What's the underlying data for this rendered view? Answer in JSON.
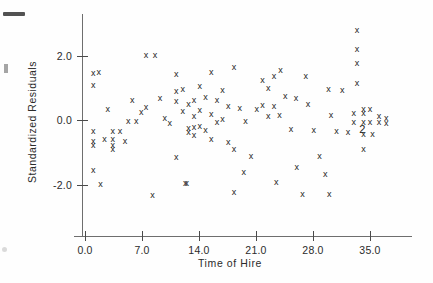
{
  "figure": {
    "marker_glyph": "x",
    "background_color": "#fefefe",
    "axis_color": "#6e6e6e",
    "marker_color": "#1d1d1d"
  },
  "artifacts": {
    "top_bar": "scan-artifact-bar",
    "speck": "scan-artifact-speck"
  },
  "chart_data": {
    "type": "scatter",
    "title": "",
    "xlabel": "Time of Hire",
    "ylabel": "Standardized Residuals",
    "xlim": [
      -1.1,
      39.5
    ],
    "ylim": [
      -3.35,
      3.45
    ],
    "xticks": [
      0.0,
      7.0,
      14.0,
      21.0,
      28.0,
      35.0
    ],
    "xticklabels": [
      "0.0",
      "7.0",
      "14.0",
      "21.0",
      "28.0",
      "35.0"
    ],
    "yticks": [
      2.0,
      0.0,
      -2.0
    ],
    "yticklabels": [
      "2.0",
      "0.0",
      "-2.0"
    ],
    "grid": false,
    "legend": null,
    "marker": "x",
    "series": [
      {
        "name": "residuals",
        "points": [
          [
            1.0,
            1.43
          ],
          [
            1.7,
            1.46
          ],
          [
            1.0,
            1.06
          ],
          [
            2.8,
            0.34
          ],
          [
            1.0,
            -0.37
          ],
          [
            1.0,
            -0.68
          ],
          [
            1.0,
            -0.78
          ],
          [
            1.0,
            -1.58
          ],
          [
            3.4,
            -0.37
          ],
          [
            3.4,
            -0.62
          ],
          [
            3.4,
            -0.78
          ],
          [
            3.4,
            -0.93
          ],
          [
            4.3,
            -0.37
          ],
          [
            1.9,
            -1.99
          ],
          [
            5.3,
            -0.06
          ],
          [
            6.3,
            -0.06
          ],
          [
            6.9,
            0.22
          ],
          [
            7.5,
            0.4
          ],
          [
            7.5,
            1.99
          ],
          [
            8.3,
            -2.33
          ],
          [
            9.2,
            0.68
          ],
          [
            9.8,
            0.06
          ],
          [
            10.4,
            -0.12
          ],
          [
            11.2,
            1.4
          ],
          [
            11.2,
            0.87
          ],
          [
            11.2,
            0.56
          ],
          [
            11.2,
            -1.15
          ],
          [
            12.0,
            0.96
          ],
          [
            12.0,
            0.25
          ],
          [
            12.7,
            0.49
          ],
          [
            12.7,
            -0.25
          ],
          [
            12.7,
            -0.4
          ],
          [
            13.4,
            0.62
          ],
          [
            13.4,
            0.12
          ],
          [
            13.4,
            -0.22
          ],
          [
            13.4,
            -0.49
          ],
          [
            14.1,
            1.03
          ],
          [
            14.1,
            0.31
          ],
          [
            14.1,
            -0.21
          ],
          [
            14.8,
            0.71
          ],
          [
            14.8,
            -0.34
          ],
          [
            15.5,
            1.46
          ],
          [
            15.5,
            0.18
          ],
          [
            15.5,
            -0.62
          ],
          [
            16.2,
            0.62
          ],
          [
            16.2,
            -0.09
          ],
          [
            16.9,
            0.9
          ],
          [
            16.9,
            0.03
          ],
          [
            17.6,
            0.43
          ],
          [
            17.6,
            -0.71
          ],
          [
            18.3,
            1.62
          ],
          [
            18.3,
            -0.93
          ],
          [
            18.3,
            -2.24
          ],
          [
            19.0,
            0.37
          ],
          [
            19.7,
            -0.06
          ],
          [
            20.4,
            -1.12
          ],
          [
            21.1,
            0.34
          ],
          [
            21.8,
            1.21
          ],
          [
            21.8,
            0.46
          ],
          [
            22.5,
            0.99
          ],
          [
            22.5,
            0.12
          ],
          [
            23.2,
            1.34
          ],
          [
            23.2,
            0.43
          ],
          [
            23.9,
            0.15
          ],
          [
            24.0,
            1.53
          ],
          [
            24.6,
            0.74
          ],
          [
            25.3,
            -0.28
          ],
          [
            26.0,
            -1.46
          ],
          [
            26.7,
            -2.3
          ],
          [
            27.4,
            0.49
          ],
          [
            28.1,
            -0.34
          ],
          [
            28.8,
            -1.12
          ],
          [
            29.5,
            -1.68
          ],
          [
            30.2,
            0.15
          ],
          [
            30.9,
            -0.37
          ],
          [
            31.6,
            0.93
          ],
          [
            32.3,
            -0.4
          ],
          [
            33.0,
            0.21
          ],
          [
            33.0,
            -0.09
          ],
          [
            33.4,
            1.12
          ],
          [
            33.4,
            2.18
          ],
          [
            33.4,
            2.79
          ],
          [
            33.4,
            1.75
          ],
          [
            34.2,
            0.34
          ],
          [
            34.2,
            0.21
          ],
          [
            34.2,
            -0.09
          ],
          [
            34.2,
            -0.46
          ],
          [
            34.2,
            -0.9
          ],
          [
            35.0,
            0.34
          ],
          [
            35.0,
            -0.09
          ],
          [
            35.3,
            -0.46
          ],
          [
            36.1,
            0.12
          ],
          [
            36.1,
            -0.09
          ],
          [
            37.0,
            0.06
          ],
          [
            37.0,
            -0.12
          ],
          [
            2.4,
            -0.62
          ],
          [
            4.9,
            -0.68
          ],
          [
            19.5,
            -1.62
          ],
          [
            23.5,
            -1.93
          ],
          [
            30.0,
            -2.3
          ],
          [
            12.3,
            -1.96
          ],
          [
            12.5,
            -1.96
          ],
          [
            8.6,
            1.99
          ],
          [
            5.8,
            0.62
          ],
          [
            25.9,
            0.68
          ],
          [
            27.1,
            1.34
          ],
          [
            29.9,
            0.96
          ]
        ]
      }
    ],
    "overlap_labels": [
      {
        "x": 34.0,
        "y": -0.28,
        "text": "2",
        "note": "two coincident observations"
      }
    ]
  }
}
